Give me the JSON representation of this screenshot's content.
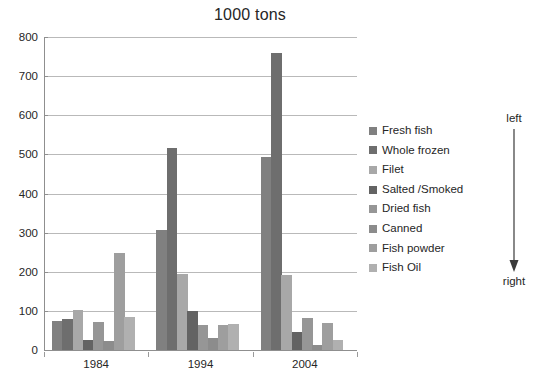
{
  "chart_data": {
    "type": "bar",
    "title": "1000 tons",
    "xlabel": "",
    "ylabel": "",
    "categories": [
      "1984",
      "1994",
      "2004"
    ],
    "ylim": [
      0,
      800
    ],
    "y_ticks": [
      0,
      100,
      200,
      300,
      400,
      500,
      600,
      700,
      800
    ],
    "grid": true,
    "legend_position": "right",
    "series": [
      {
        "name": "Fresh fish",
        "color": "#808080",
        "values": [
          75,
          308,
          494
        ]
      },
      {
        "name": "Whole frozen",
        "color": "#6e6e6e",
        "values": [
          80,
          517,
          760
        ]
      },
      {
        "name": "Filet",
        "color": "#a8a8a8",
        "values": [
          101,
          194,
          192
        ]
      },
      {
        "name": "Salted /Smoked",
        "color": "#636363",
        "values": [
          25,
          100,
          45
        ]
      },
      {
        "name": "Dried fish",
        "color": "#969696",
        "values": [
          72,
          65,
          82
        ]
      },
      {
        "name": "Canned",
        "color": "#8c8c8c",
        "values": [
          23,
          30,
          12
        ]
      },
      {
        "name": "Fish powder",
        "color": "#9e9e9e",
        "values": [
          248,
          65,
          68
        ]
      },
      {
        "name": "Fish Oil",
        "color": "#b0b0b0",
        "values": [
          85,
          67,
          26
        ]
      }
    ]
  },
  "annotation": {
    "top_label": "left",
    "bottom_label": "right",
    "arrow_direction": "down"
  }
}
